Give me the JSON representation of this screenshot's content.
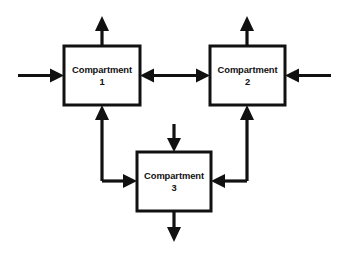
{
  "diagram": {
    "type": "compartment-flow-diagram",
    "background_color": "#ffffff",
    "stroke_color": "#111111",
    "boxes": [
      {
        "id": "compartment-1",
        "label": "Compartment",
        "number": "1",
        "x": 64,
        "y": 46,
        "width": 76,
        "height": 59
      },
      {
        "id": "compartment-2",
        "label": "Compartment",
        "number": "2",
        "x": 210,
        "y": 46,
        "width": 75,
        "height": 59
      },
      {
        "id": "compartment-3",
        "label": "Compartment",
        "number": "3",
        "x": 137,
        "y": 152,
        "width": 74,
        "height": 59
      }
    ],
    "arrows": [
      {
        "id": "input-to-compartment-1",
        "direction": "right",
        "description": "external input entering Compartment 1 from the left"
      },
      {
        "id": "output-from-compartment-1",
        "direction": "up",
        "description": "external output leaving Compartment 1 upward"
      },
      {
        "id": "input-to-compartment-2",
        "direction": "left",
        "description": "external input entering Compartment 2 from the right"
      },
      {
        "id": "output-from-compartment-2",
        "direction": "up",
        "description": "external output leaving Compartment 2 upward"
      },
      {
        "id": "input-to-compartment-3",
        "direction": "down",
        "description": "external input entering Compartment 3 from above"
      },
      {
        "id": "output-from-compartment-3",
        "direction": "down",
        "description": "external output leaving Compartment 3 downward"
      },
      {
        "id": "exchange-compartment-1-2",
        "direction": "bidirectional",
        "description": "two-way exchange between Compartment 1 and Compartment 2"
      },
      {
        "id": "transfer-compartment-3-to-1",
        "direction": "up",
        "description": "transfer from Compartment 3 region up into Compartment 1"
      },
      {
        "id": "transfer-compartment-1-to-3",
        "direction": "right",
        "description": "transfer entering Compartment 3 from the left"
      },
      {
        "id": "transfer-compartment-3-to-2",
        "direction": "up",
        "description": "transfer from Compartment 3 region up into Compartment 2"
      },
      {
        "id": "transfer-compartment-2-to-3",
        "direction": "left",
        "description": "transfer entering Compartment 3 from the right"
      }
    ]
  }
}
